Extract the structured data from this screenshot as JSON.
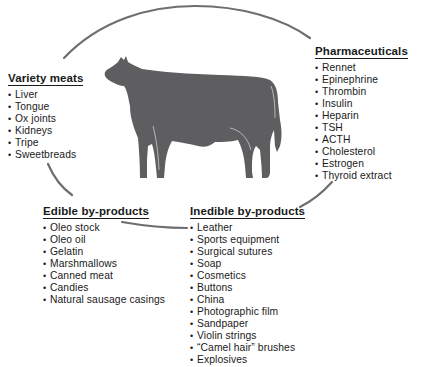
{
  "diagram": {
    "central_figure": "cow-silhouette",
    "colors": {
      "cow": "#5e5e60",
      "oval_line": "#6e6e70",
      "text": "#1a1a1a",
      "background": "#ffffff"
    },
    "groups": [
      {
        "id": "variety",
        "title": "Variety meats",
        "items": [
          "Liver",
          "Tongue",
          "Ox joints",
          "Kidneys",
          "Tripe",
          "Sweetbreads"
        ]
      },
      {
        "id": "pharma",
        "title": "Pharmaceuticals",
        "items": [
          "Rennet",
          "Epinephrine",
          "Thrombin",
          "Insulin",
          "Heparin",
          "TSH",
          "ACTH",
          "Cholesterol",
          "Estrogen",
          "Thyroid extract"
        ]
      },
      {
        "id": "edible",
        "title": "Edible by-products",
        "items": [
          "Oleo stock",
          "Oleo oil",
          "Gelatin",
          "Marshmallows",
          "Canned meat",
          "Candies",
          "Natural sausage casings"
        ]
      },
      {
        "id": "inedible",
        "title": "Inedible by-products",
        "items": [
          "Leather",
          "Sports equipment",
          "Surgical sutures",
          "Soap",
          "Cosmetics",
          "Buttons",
          "China",
          "Photographic film",
          "Sandpaper",
          "Violin strings",
          "“Camel hair” brushes",
          "Explosives"
        ]
      }
    ],
    "bullet": "•"
  }
}
